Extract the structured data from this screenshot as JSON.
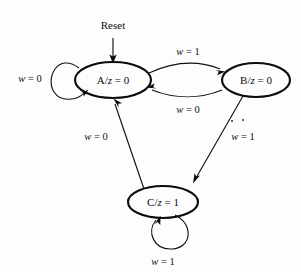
{
  "figure": {
    "type": "state-transition-diagram",
    "background_color": "#fdfdfd",
    "ink_color": "#0b0b0b",
    "width": 301,
    "height": 272
  },
  "reset": {
    "label": "Reset",
    "target_state": "A"
  },
  "states": [
    {
      "id": "A",
      "label": "A/z = 0",
      "name": "A",
      "output_var": "z",
      "output_value": "0",
      "cx": 113,
      "cy": 80,
      "rx": 38,
      "ry": 18
    },
    {
      "id": "B",
      "label": "B/z = 0",
      "name": "B",
      "output_var": "z",
      "output_value": "0",
      "cx": 256,
      "cy": 80,
      "rx": 34,
      "ry": 17
    },
    {
      "id": "C",
      "label": "C/z = 1",
      "name": "C",
      "output_var": "z",
      "output_value": "1",
      "cx": 163,
      "cy": 202,
      "rx": 35,
      "ry": 16
    }
  ],
  "transitions": [
    {
      "id": "a-self",
      "from": "A",
      "to": "A",
      "label": "w = 0",
      "condition_var": "w",
      "condition_value": "0",
      "label_x": 30,
      "label_y": 82
    },
    {
      "id": "a-to-b",
      "from": "A",
      "to": "B",
      "label": "w = 1",
      "condition_var": "w",
      "condition_value": "1",
      "label_x": 188,
      "label_y": 55
    },
    {
      "id": "b-to-a",
      "from": "B",
      "to": "A",
      "label": "w = 0",
      "condition_var": "w",
      "condition_value": "0",
      "label_x": 188,
      "label_y": 110
    },
    {
      "id": "b-to-c",
      "from": "B",
      "to": "C",
      "label": "w = 1",
      "condition_var": "w",
      "condition_value": "1",
      "label_x": 243,
      "label_y": 136
    },
    {
      "id": "c-to-a",
      "from": "C",
      "to": "A",
      "label": "w = 0",
      "condition_var": "w",
      "condition_value": "0",
      "label_x": 96,
      "label_y": 137
    },
    {
      "id": "c-self",
      "from": "C",
      "to": "C",
      "label": "w = 1",
      "condition_var": "w",
      "condition_value": "1",
      "label_x": 163,
      "label_y": 262
    }
  ],
  "artifacts": {
    "description": "scan speckles",
    "specks": [
      {
        "x": 232,
        "y": 121,
        "r": 1.1
      },
      {
        "x": 243,
        "y": 120,
        "r": 1.0
      }
    ]
  }
}
